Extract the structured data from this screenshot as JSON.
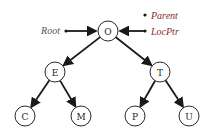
{
  "diagram": {
    "type": "binary-tree",
    "nodes": [
      {
        "id": "O",
        "label": "O",
        "x": 108,
        "y": 31
      },
      {
        "id": "E",
        "label": "E",
        "x": 55,
        "y": 72
      },
      {
        "id": "T",
        "label": "T",
        "x": 160,
        "y": 72
      },
      {
        "id": "C",
        "label": "C",
        "x": 25,
        "y": 116
      },
      {
        "id": "M",
        "label": "M",
        "x": 81,
        "y": 116
      },
      {
        "id": "P",
        "label": "P",
        "x": 135,
        "y": 116
      },
      {
        "id": "U",
        "label": "U",
        "x": 189,
        "y": 116
      }
    ],
    "edges": [
      {
        "from": "O",
        "to": "E"
      },
      {
        "from": "O",
        "to": "T"
      },
      {
        "from": "E",
        "to": "C"
      },
      {
        "from": "E",
        "to": "M"
      },
      {
        "from": "T",
        "to": "P"
      },
      {
        "from": "T",
        "to": "U"
      }
    ],
    "node_radius": 10,
    "pointers": {
      "root": {
        "label": "Root",
        "color": "#555555",
        "target": "O"
      },
      "parent": {
        "label": "Parent",
        "color": "#8b2a2a",
        "target": null
      },
      "locptr": {
        "label": "LocPtr",
        "color": "#8b2a2a",
        "target": "O"
      }
    }
  }
}
